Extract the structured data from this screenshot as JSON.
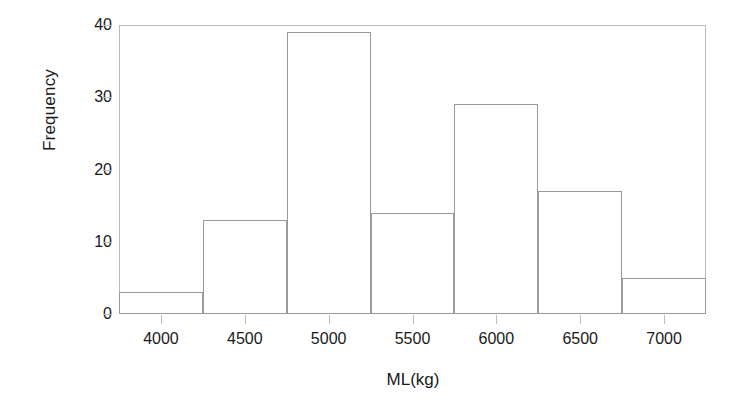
{
  "chart_data": {
    "type": "bar",
    "title": "",
    "xlabel": "ML(kg)",
    "ylabel": "Frequency",
    "grid": false,
    "legend": null,
    "xlim": [
      3750,
      7250
    ],
    "ylim": [
      0,
      40
    ],
    "bin_width": 500,
    "bin_edges": [
      3750,
      4250,
      4750,
      5250,
      5750,
      6250,
      6750,
      7250
    ],
    "categories": [
      "3750-4250",
      "4250-4750",
      "4750-5250",
      "5250-5750",
      "5750-6250",
      "6250-6750",
      "6750-7250"
    ],
    "values": [
      3,
      13,
      39,
      14,
      29,
      17,
      5
    ],
    "xticks": [
      4000,
      4500,
      5000,
      5500,
      6000,
      6500,
      7000
    ],
    "xtick_labels": [
      "4000",
      "4500",
      "5000",
      "5500",
      "6000",
      "6500",
      "7000"
    ],
    "yticks": [
      0,
      10,
      20,
      30,
      40
    ],
    "ytick_labels": [
      "0",
      "10",
      "20",
      "30",
      "40"
    ],
    "bar_edge_color": "#9a9a9a",
    "bar_fill_color": "#ffffff",
    "frame_color": "#b9b9b9",
    "text_color": "#1a1a1a",
    "background_color": "#ffffff"
  }
}
